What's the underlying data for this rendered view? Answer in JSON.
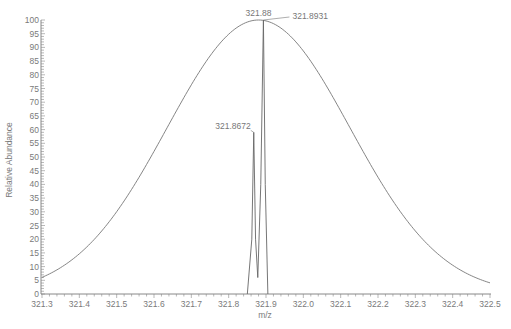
{
  "chart_data": {
    "type": "line",
    "title": "",
    "xlabel": "m/z",
    "ylabel": "Relative Abundance",
    "xlim": [
      321.3,
      322.5
    ],
    "ylim": [
      0,
      100
    ],
    "x_ticks": [
      "321.3",
      "321.4",
      "321.5",
      "321.6",
      "321.7",
      "321.8",
      "321.9",
      "322.0",
      "322.1",
      "322.2",
      "322.3",
      "322.4",
      "322.5"
    ],
    "y_ticks": [
      "0",
      "5",
      "10",
      "15",
      "20",
      "25",
      "30",
      "35",
      "40",
      "45",
      "50",
      "55",
      "60",
      "65",
      "70",
      "75",
      "80",
      "85",
      "90",
      "95",
      "100"
    ],
    "grid": false,
    "legend": null,
    "series": [
      {
        "name": "theoretical envelope",
        "style": "smooth gaussian",
        "center": 321.88,
        "peak": 100,
        "x": [
          321.3,
          321.4,
          321.5,
          321.6,
          321.7,
          321.8,
          321.88,
          321.9,
          322.0,
          322.1,
          322.2,
          322.3,
          322.4,
          322.5
        ],
        "y": [
          1,
          6,
          19,
          41,
          68,
          92,
          100,
          99,
          86,
          60,
          32,
          12,
          3,
          2
        ]
      },
      {
        "name": "measured profile",
        "style": "sharp peaks",
        "x": [
          321.85,
          321.862,
          321.8672,
          321.872,
          321.878,
          321.886,
          321.8931,
          321.898,
          321.905
        ],
        "y": [
          0,
          20,
          59,
          20,
          6,
          40,
          100,
          40,
          0
        ]
      }
    ],
    "annotations": [
      {
        "text": "321.88",
        "x": 321.88,
        "y": 100,
        "color": "#9a9a9a"
      },
      {
        "text": "321.8931",
        "x": 321.8931,
        "y": 100
      },
      {
        "text": "321.8672",
        "x": 321.8672,
        "y": 59
      }
    ]
  }
}
